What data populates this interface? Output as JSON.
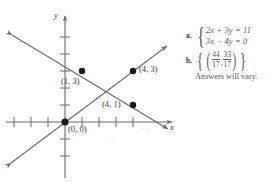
{
  "figure": {
    "kind": "coordinate-graph-with-answer-key",
    "axes": {
      "x_label": "x",
      "y_label": "y",
      "x_range": [
        -4,
        6
      ],
      "y_range": [
        -4,
        6
      ],
      "tick_spacing": 1,
      "grid": false
    },
    "points": [
      {
        "label": "(1, 3)",
        "x": 1,
        "y": 3,
        "label_pos": "below-left"
      },
      {
        "label": "(4, 3)",
        "x": 4,
        "y": 3,
        "label_pos": "right"
      },
      {
        "label": "(4, 1)",
        "x": 4,
        "y": 1,
        "label_pos": "left"
      },
      {
        "label": "(0, 0)",
        "x": 0,
        "y": 0,
        "label_pos": "below-right"
      }
    ],
    "lines": [
      {
        "name": "rising-line",
        "through": [
          "(0, 0)",
          "(4, 3)"
        ],
        "slope": 0.75,
        "arrows": "both"
      },
      {
        "name": "falling-line",
        "through": [
          "(1, 3)",
          "(4, 1)"
        ],
        "slope": -0.6667,
        "arrows": "both"
      }
    ],
    "ink_color": "#6d6763",
    "point_color": "#1c1a19"
  },
  "answers": {
    "item_a": {
      "key": "a.",
      "equations": [
        {
          "lhs_a": "2",
          "var1": "x",
          "op": "+",
          "lhs_b": "3",
          "var2": "y",
          "eq": "=",
          "rhs": "11"
        },
        {
          "lhs_a": "3",
          "var1": "x",
          "op": "−",
          "lhs_b": "4",
          "var2": "y",
          "eq": "=",
          "rhs": "0"
        }
      ],
      "eq_line_1": "2x + 3y = 11",
      "eq_line_2": "3x − 4y = 0"
    },
    "item_b": {
      "key": "b.",
      "solution_text": "{(44/17, 33/17)}",
      "fraction_1": {
        "numerator": "44",
        "denominator": "17"
      },
      "fraction_2": {
        "numerator": "33",
        "denominator": "17"
      },
      "comma": ",",
      "outer_brace_open": "{",
      "outer_brace_close": "}",
      "paren_open": "(",
      "paren_close": ")"
    },
    "note": "Answers will vary."
  }
}
